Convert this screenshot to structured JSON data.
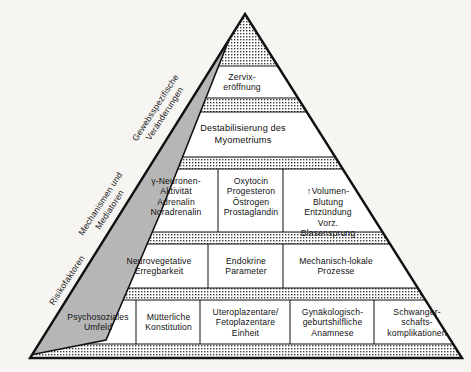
{
  "figure": {
    "type": "pyramid-diagram",
    "title": "",
    "language": "de",
    "colors": {
      "background": "#f6f5f2",
      "outline": "#111111",
      "wedge_fill": "#b6b6b6",
      "stipple_dot": "#3a3a3a",
      "text": "#111111"
    }
  },
  "side_wedge": {
    "name": "risk-axis-wedge",
    "labels": [
      {
        "id": "tissue",
        "text": "Gewebsspezifische\nVeränderungen",
        "rotation": -57
      },
      {
        "id": "mechanisms",
        "text": "Mechanismen und\nMediatoren",
        "rotation": -57
      },
      {
        "id": "risk",
        "text": "Risikofaktoren",
        "rotation": -57
      }
    ]
  },
  "tiers": [
    {
      "id": "apex",
      "name": "apex-stippled",
      "fill": "stipple",
      "cells": []
    },
    {
      "id": "tier-zervix",
      "name": "tier-cervical-dilation",
      "fill": "white",
      "cells": [
        {
          "id": "zervixeroeffnung",
          "text": "Zervix-\neröffnung"
        }
      ]
    },
    {
      "id": "tier-destabilisierung",
      "name": "tier-myometrium-destabilization",
      "fill": "white",
      "cells": [
        {
          "id": "destabilisierung",
          "text": "Destabilisierung des\nMyometriums"
        }
      ]
    },
    {
      "id": "tier-mediators",
      "name": "tier-mediators",
      "fill": "white",
      "cells": [
        {
          "id": "neurotransmitter",
          "text": "γ-Neuronen-\nAktivität\nAdrenalin\nNoradrenalin"
        },
        {
          "id": "hormones",
          "text": "Oxytocin\nProgesteron\nÖstrogen\nProstaglandin"
        },
        {
          "id": "local-events",
          "text": "Volumen-\nBlutung\nEntzündung\nVorz.\nBlasensprung",
          "prefix_icon": "↑"
        }
      ]
    },
    {
      "id": "tier-mechanisms",
      "name": "tier-mechanisms",
      "fill": "white",
      "cells": [
        {
          "id": "neurovegetative",
          "text": "Neurovegetative\nErregbarkeit"
        },
        {
          "id": "endokrine",
          "text": "Endokrine\nParameter"
        },
        {
          "id": "mechanisch-lokale",
          "text": "Mechanisch-lokale\nProzesse"
        }
      ]
    },
    {
      "id": "tier-risk-factors",
      "name": "tier-risk-factors",
      "fill": "white",
      "cells": [
        {
          "id": "psychosozial",
          "text": "Psychosoziales\nUmfeld"
        },
        {
          "id": "muetterlich",
          "text": "Mütterliche\nKonstitution"
        },
        {
          "id": "uteroplazentar",
          "text": "Uteroplazentare/\nFetoplazentare\nEinheit"
        },
        {
          "id": "gynaekologisch",
          "text": "Gynäkologisch-\ngeburtshilfliche\nAnamnese"
        },
        {
          "id": "schwangerschaft",
          "text": "Schwanger-\nschafts-\nkomplikationen"
        }
      ]
    }
  ]
}
